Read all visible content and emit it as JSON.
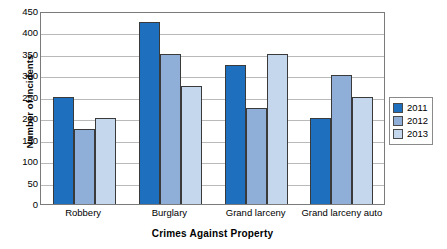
{
  "chart_data": {
    "type": "bar",
    "title": "",
    "xlabel": "Crimes Against Property",
    "ylabel": "Number of Incidents",
    "categories": [
      "Robbery",
      "Burglary",
      "Grand larceny",
      "Grand larceny auto"
    ],
    "series": [
      {
        "name": "2011",
        "color": "#1f6fbf",
        "values": [
          250,
          425,
          325,
          200
        ]
      },
      {
        "name": "2012",
        "color": "#8fafd8",
        "values": [
          175,
          350,
          225,
          300
        ]
      },
      {
        "name": "2013",
        "color": "#c5d7ec",
        "values": [
          200,
          275,
          350,
          250
        ]
      }
    ],
    "ylim": [
      0,
      450
    ],
    "yticks": [
      0,
      50,
      100,
      150,
      200,
      250,
      300,
      350,
      400,
      450
    ],
    "ytick_labels": [
      "0",
      "50",
      "100",
      "150",
      "200",
      "250",
      "300",
      "350",
      "400",
      "450"
    ],
    "grid": true,
    "grid_axis": "y",
    "legend_position": "right",
    "legend_entries": [
      "2011",
      "2012",
      "2013"
    ]
  }
}
